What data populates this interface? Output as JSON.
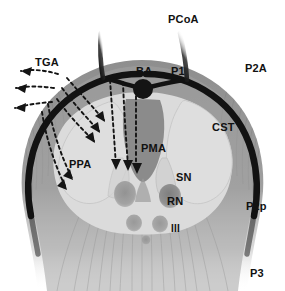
{
  "figure": {
    "background": "#ffffff",
    "width": 285,
    "height": 291
  },
  "colors": {
    "artery_dark": "#121212",
    "midbrain_outer": "#8e8e8e",
    "tegmentum_band": "#a5a5a5",
    "peduncle_light": "#d9d9d9",
    "cst_light": "#dcdcdc",
    "pma_wedge": "#7f7f7f",
    "nucleus_dark": "#9a9a9a",
    "rn_dark": "#8a8a8a",
    "striation": "#7a7a7a",
    "arrow": "#141414",
    "label_text": "#111111"
  },
  "labels": [
    {
      "id": "pcoa",
      "text": "PCoA",
      "x": 168,
      "y": 14,
      "desc": "posterior communicating artery"
    },
    {
      "id": "tga",
      "text": "TGA",
      "x": 35,
      "y": 57,
      "desc": "thalamogeniculate arteries"
    },
    {
      "id": "ba",
      "text": "BA",
      "x": 136,
      "y": 66,
      "desc": "basilar artery"
    },
    {
      "id": "p1",
      "text": "P1",
      "x": 171,
      "y": 66,
      "desc": "P1 segment"
    },
    {
      "id": "p2a",
      "text": "P2A",
      "x": 245,
      "y": 63,
      "desc": "P2 anterior segment"
    },
    {
      "id": "cst",
      "text": "CST",
      "x": 212,
      "y": 122,
      "desc": "corticospinal tract"
    },
    {
      "id": "pma",
      "text": "PMA",
      "x": 141,
      "y": 143,
      "desc": "posteromedial arteries"
    },
    {
      "id": "ppa",
      "text": "PPA",
      "x": 69,
      "y": 159,
      "desc": "peduncular perforating arteries"
    },
    {
      "id": "sn",
      "text": "SN",
      "x": 176,
      "y": 172,
      "desc": "substantia nigra"
    },
    {
      "id": "rn",
      "text": "RN",
      "x": 167,
      "y": 196,
      "desc": "red nucleus"
    },
    {
      "id": "iii",
      "text": "III",
      "x": 171,
      "y": 224,
      "desc": "oculomotor nerve nucleus"
    },
    {
      "id": "p2p",
      "text": "P2p",
      "x": 246,
      "y": 201,
      "desc": "P2 posterior segment"
    },
    {
      "id": "p3",
      "text": "P3",
      "x": 250,
      "y": 268,
      "desc": "P3 segment"
    }
  ],
  "arrow_groups": [
    {
      "id": "tga-arrows",
      "name": "thalamogeniculate-arrows",
      "count": 3,
      "direction": "outward-left",
      "style": "dashed-with-solid-head"
    },
    {
      "id": "ppa-arrows",
      "name": "peduncular-perforating-arrows",
      "count": 6,
      "direction": "curving-down-right",
      "style": "dashed-with-solid-head"
    },
    {
      "id": "pma-arrows",
      "name": "posteromedial-perforating-arrows",
      "count": 3,
      "direction": "downward",
      "style": "dashed-with-solid-head"
    }
  ],
  "structures": [
    {
      "id": "basilar-artery",
      "shape": "filled-circle",
      "label": "BA"
    },
    {
      "id": "p1-left",
      "shape": "vessel-line",
      "label": "P1"
    },
    {
      "id": "p1-right",
      "shape": "vessel-line",
      "label": "P1"
    },
    {
      "id": "pcoa-left",
      "shape": "vessel-line",
      "label": "PCoA"
    },
    {
      "id": "pcoa-right",
      "shape": "vessel-line",
      "label": "PCoA"
    },
    {
      "id": "p2-ring",
      "shape": "encircling-artery",
      "label": "P2A / P2p"
    },
    {
      "id": "midbrain-body",
      "shape": "heart-silhouette",
      "label": "midbrain"
    },
    {
      "id": "cerebral-peduncle-left",
      "shape": "teardrop",
      "label": "PPA"
    },
    {
      "id": "cerebral-peduncle-right",
      "shape": "teardrop",
      "label": "CST"
    },
    {
      "id": "substantia-nigra",
      "shape": "curved-band",
      "label": "SN"
    },
    {
      "id": "red-nucleus-left",
      "shape": "oval",
      "label": ""
    },
    {
      "id": "red-nucleus-right",
      "shape": "oval",
      "label": "RN"
    },
    {
      "id": "oculomotor-nucleus-left",
      "shape": "oval",
      "label": ""
    },
    {
      "id": "oculomotor-nucleus-right",
      "shape": "oval",
      "label": "III"
    },
    {
      "id": "midline-nucleus",
      "shape": "small-oval",
      "label": ""
    },
    {
      "id": "pma-wedge",
      "shape": "inverted-triangle",
      "label": "PMA"
    }
  ]
}
